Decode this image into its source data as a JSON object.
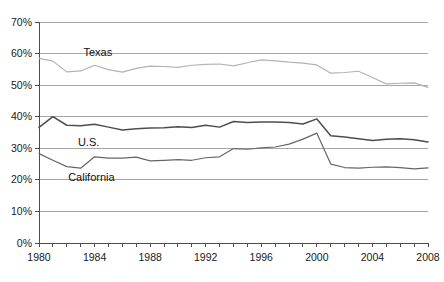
{
  "chart_data": {
    "type": "line",
    "title": "",
    "subtitle": "",
    "xlabel": "",
    "ylabel": "",
    "xlim": [
      1980,
      2008
    ],
    "ylim": [
      0,
      70
    ],
    "ytick_values": [
      0,
      10,
      20,
      30,
      40,
      50,
      60,
      70
    ],
    "ytick_labels": [
      "0%",
      "10%",
      "20%",
      "30%",
      "40%",
      "50%",
      "60%",
      "70%"
    ],
    "xtick_values": [
      1980,
      1981,
      1982,
      1983,
      1984,
      1985,
      1986,
      1987,
      1988,
      1989,
      1990,
      1991,
      1992,
      1993,
      1994,
      1995,
      1996,
      1997,
      1998,
      1999,
      2000,
      2001,
      2002,
      2003,
      2004,
      2005,
      2006,
      2007,
      2008
    ],
    "xtick_labels_shown": [
      "1980",
      "1984",
      "1988",
      "1992",
      "1996",
      "2000",
      "2004",
      "2008"
    ],
    "xtick_labels_shown_values": [
      1980,
      1984,
      1988,
      1992,
      1996,
      2000,
      2004,
      2008
    ],
    "grid": "horizontal",
    "legend": "inline-annotations",
    "x": [
      1980,
      1981,
      1982,
      1983,
      1984,
      1985,
      1986,
      1987,
      1988,
      1989,
      1990,
      1991,
      1992,
      1993,
      1994,
      1995,
      1996,
      1997,
      1998,
      1999,
      2000,
      2001,
      2002,
      2003,
      2004,
      2005,
      2006,
      2007,
      2008
    ],
    "series": [
      {
        "name": "Texas",
        "color": "#b3b3b3",
        "values": [
          58.5,
          57.6,
          54.2,
          54.5,
          56.3,
          54.9,
          54.1,
          55.3,
          56.0,
          55.9,
          55.6,
          56.3,
          56.6,
          56.7,
          56.1,
          57.1,
          58.0,
          57.7,
          57.3,
          57.0,
          56.4,
          53.8,
          54.0,
          54.4,
          52.4,
          50.4,
          50.6,
          50.7,
          49.3
        ]
      },
      {
        "name": "U.S.",
        "color": "#4d4d4d",
        "values": [
          36.6,
          40.0,
          37.3,
          37.1,
          37.6,
          36.7,
          35.8,
          36.2,
          36.4,
          36.5,
          36.8,
          36.6,
          37.3,
          36.7,
          38.5,
          38.2,
          38.3,
          38.3,
          38.2,
          37.7,
          39.3,
          34.0,
          33.6,
          33.0,
          32.5,
          32.9,
          33.0,
          32.7,
          32.0
        ]
      },
      {
        "name": "California",
        "color": "#666666",
        "values": [
          28.3,
          26.2,
          24.2,
          23.7,
          27.3,
          26.9,
          26.9,
          27.2,
          26.0,
          26.2,
          26.4,
          26.2,
          27.0,
          27.3,
          29.9,
          29.7,
          30.1,
          30.4,
          31.3,
          32.9,
          34.8,
          25.0,
          23.9,
          23.7,
          24.0,
          24.1,
          23.9,
          23.5,
          23.8
        ]
      }
    ],
    "annotations": [
      {
        "text": "Texas",
        "x": 1983.2,
        "y": 60.2
      },
      {
        "text": "U.S.",
        "x": 1982.8,
        "y": 31.8
      },
      {
        "text": "California",
        "x": 1982.1,
        "y": 20.6
      }
    ]
  }
}
